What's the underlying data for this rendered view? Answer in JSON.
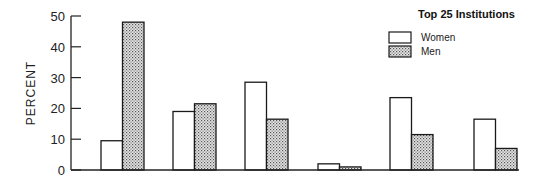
{
  "chart_data": {
    "type": "bar",
    "title": "",
    "legend_title": "Top 25 Institutions",
    "xlabel": "",
    "ylabel": "PERCENT",
    "ylim": [
      0,
      50
    ],
    "yticks": [
      0,
      10,
      20,
      30,
      40,
      50
    ],
    "categories": [
      "",
      "",
      "",
      "",
      "",
      ""
    ],
    "series": [
      {
        "name": "Women",
        "pattern": "open",
        "values": [
          9.5,
          19,
          28.5,
          2,
          23.5,
          16.5
        ]
      },
      {
        "name": "Men",
        "pattern": "stippled",
        "values": [
          48,
          21.5,
          16.5,
          1,
          11.5,
          7
        ]
      }
    ],
    "grid": false,
    "legend_position": "upper right"
  },
  "colors": {
    "axis": "#222222",
    "bar_outline": "#1a1a1a",
    "women_fill": "#ffffff",
    "men_fill": "#d8d8d8",
    "stipple_dot": "#555555"
  }
}
